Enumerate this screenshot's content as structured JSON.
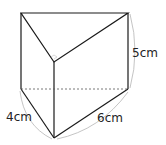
{
  "figure": {
    "type": "triangular-prism",
    "labels": {
      "height": "5cm",
      "short_base_edge": "4cm",
      "long_base_edge": "6cm"
    },
    "right_angle_marker": true,
    "colors": {
      "edge": "#1a1a1a",
      "hidden_edge": "#555555",
      "dimension_brace": "#b5b5b5"
    }
  }
}
